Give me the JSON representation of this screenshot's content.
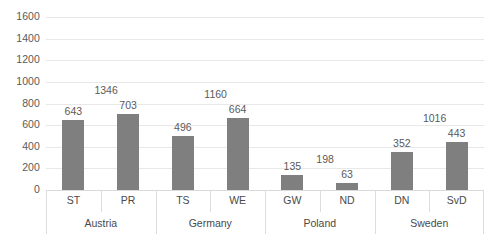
{
  "chart_data": {
    "type": "bar",
    "title": "",
    "subtitle": "",
    "xlabel": "",
    "ylabel": "",
    "ylim": [
      0,
      1600
    ],
    "ytick_step": 200,
    "grid": true,
    "legend": "none",
    "bar_color": "#7f7f7f",
    "gridline_color": "#e8e8e8",
    "categories": [
      "ST",
      "PR",
      "TS",
      "WE",
      "GW",
      "ND",
      "DN",
      "SvD"
    ],
    "values": [
      643,
      703,
      496,
      664,
      135,
      63,
      352,
      443
    ],
    "secondary_labels": [
      null,
      1346,
      null,
      1160,
      null,
      198,
      null,
      1016
    ],
    "groups": [
      {
        "label": "Austria",
        "members": [
          "ST",
          "PR"
        ]
      },
      {
        "label": "Germany",
        "members": [
          "TS",
          "WE"
        ]
      },
      {
        "label": "Poland",
        "members": [
          "GW",
          "ND"
        ]
      },
      {
        "label": "Sweden",
        "members": [
          "DN",
          "SvD"
        ]
      }
    ],
    "yticks": [
      "1600",
      "1400",
      "1200",
      "1000",
      "800",
      "600",
      "400",
      "200",
      "0"
    ],
    "series": [
      {
        "name": "primary",
        "values": [
          643,
          703,
          496,
          664,
          135,
          63,
          352,
          443
        ]
      },
      {
        "name": "secondary-labels-only",
        "values": [
          null,
          1346,
          null,
          1160,
          null,
          198,
          null,
          1016
        ]
      }
    ]
  },
  "axis": {
    "y_max_label": "1600",
    "y_min_label": "0"
  }
}
